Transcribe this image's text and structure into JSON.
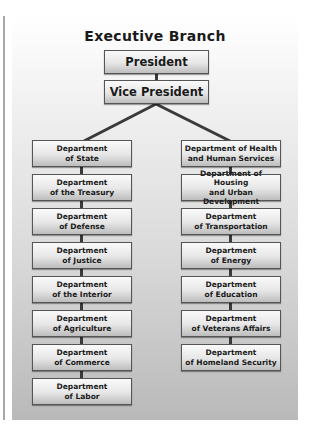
{
  "title": "Executive Branch",
  "top": [
    {
      "label": "President"
    },
    {
      "label": "Vice President"
    }
  ],
  "left_column": [
    {
      "line1": "Department",
      "line2": "of State"
    },
    {
      "line1": "Department",
      "line2": "of the Treasury"
    },
    {
      "line1": "Department",
      "line2": "of Defense"
    },
    {
      "line1": "Department",
      "line2": "of Justice"
    },
    {
      "line1": "Department",
      "line2": "of the Interior"
    },
    {
      "line1": "Department",
      "line2": "of Agriculture"
    },
    {
      "line1": "Department",
      "line2": "of Commerce"
    },
    {
      "line1": "Department",
      "line2": "of Labor"
    }
  ],
  "right_column": [
    {
      "line1": "Department of Health",
      "line2": "and Human Services"
    },
    {
      "line1": "Department of Housing",
      "line2": "and Urban Development"
    },
    {
      "line1": "Department",
      "line2": "of Transportation"
    },
    {
      "line1": "Department",
      "line2": "of Energy"
    },
    {
      "line1": "Department",
      "line2": "of Education"
    },
    {
      "line1": "Department",
      "line2": "of Veterans Affairs"
    },
    {
      "line1": "Department",
      "line2": "of Homeland Security"
    }
  ],
  "colors": {
    "connector": "#3a3a3a",
    "box_border": "#555555",
    "panel_bottom": "#b9b9b9"
  }
}
